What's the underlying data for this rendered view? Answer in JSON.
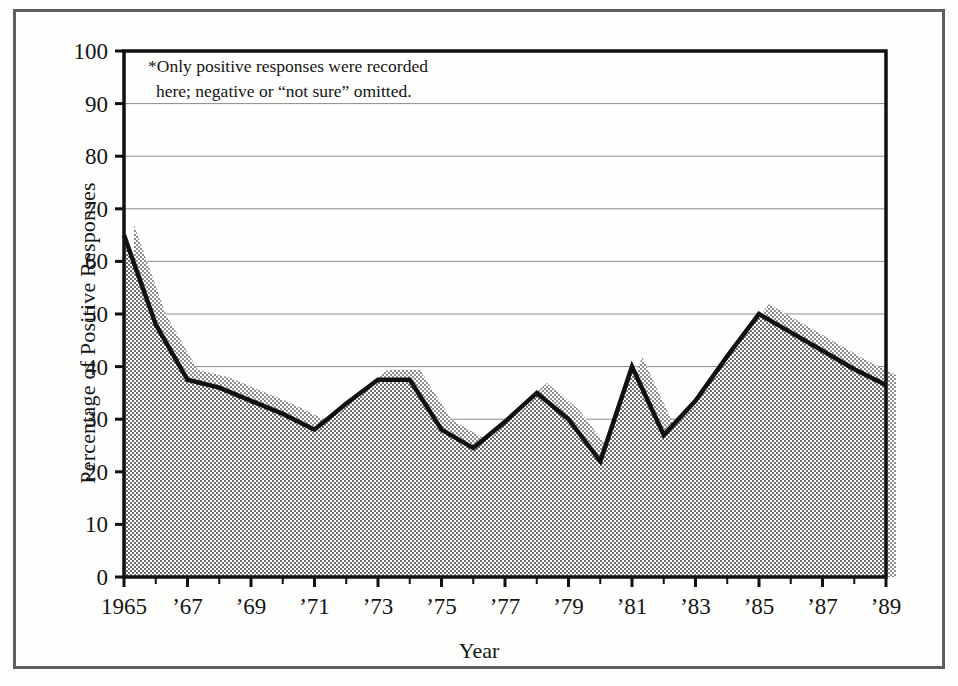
{
  "chart_data": {
    "type": "area",
    "title": "",
    "xlabel": "Year",
    "ylabel": "Percentage of Positive Responses",
    "annotation_line1": "*Only positive responses were recorded",
    "annotation_line2": "here; negative or “not sure” omitted.",
    "x": [
      1965,
      1966,
      1967,
      1968,
      1969,
      1970,
      1971,
      1972,
      1973,
      1974,
      1975,
      1976,
      1977,
      1978,
      1979,
      1980,
      1981,
      1982,
      1983,
      1984,
      1985,
      1986,
      1987,
      1988,
      1989
    ],
    "values": [
      65,
      48,
      37.5,
      36,
      33.5,
      31,
      28,
      33,
      37.5,
      37.5,
      28,
      24.5,
      29.5,
      35,
      30,
      22,
      40,
      27,
      33.5,
      42,
      50,
      46.5,
      43,
      39.5,
      36.5
    ],
    "xlim": [
      1965,
      1989
    ],
    "ylim": [
      0,
      100
    ],
    "ytick_values": [
      0,
      10,
      20,
      30,
      40,
      50,
      60,
      70,
      80,
      90,
      100
    ],
    "ytick_labels": [
      "0",
      "10",
      "20",
      "30",
      "40",
      "50",
      "60",
      "70",
      "80",
      "90",
      "100"
    ],
    "xtick_values": [
      1965,
      1967,
      1969,
      1971,
      1973,
      1975,
      1977,
      1979,
      1981,
      1983,
      1985,
      1987,
      1989
    ],
    "xtick_labels": [
      "1965",
      "’67",
      "’69",
      "’71",
      "’73",
      "’75",
      "’77",
      "’79",
      "’81",
      "’83",
      "’85",
      "’87",
      "’89"
    ],
    "grid": true,
    "legend": "none",
    "line_color": "#111111",
    "fill_color": "#9b9b9b",
    "shadow_offset_x": 10,
    "shadow_offset_y": -10
  },
  "figure": {
    "frame_color": "#5f5f5f",
    "background_color": "#fefefd"
  }
}
